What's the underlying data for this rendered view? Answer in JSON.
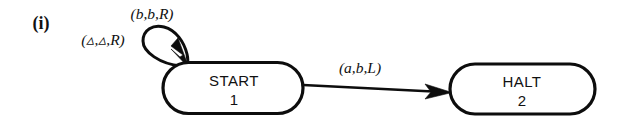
{
  "figure": {
    "tag": "(i)",
    "caption": ""
  },
  "diagram": {
    "type": "turing-machine-state-diagram",
    "background_color": "#ffffff",
    "stroke_color": "#0d0d0d",
    "nodes": [
      {
        "id": "start",
        "label": "START",
        "number": "1",
        "shape": "stadium",
        "x": 233,
        "y": 88,
        "width": 140,
        "height": 51
      },
      {
        "id": "halt",
        "label": "HALT",
        "number": "2",
        "shape": "stadium",
        "x": 522,
        "y": 89,
        "width": 145,
        "height": 50
      }
    ],
    "edges": [
      {
        "id": "self-loop-blank",
        "from": "start",
        "to": "start",
        "label": "(▵,▵,R)",
        "label_read": "blank",
        "label_write": "blank",
        "label_move": "R",
        "label_x": 103,
        "label_y": 45,
        "kind": "self-loop"
      },
      {
        "id": "self-loop-b",
        "from": "start",
        "to": "start",
        "label": "(b,b,R)",
        "label_read": "b",
        "label_write": "b",
        "label_move": "R",
        "label_x": 152,
        "label_y": 19,
        "kind": "self-loop-annotation"
      },
      {
        "id": "start-to-halt",
        "from": "start",
        "to": "halt",
        "label": "(a,b,L)",
        "label_read": "a",
        "label_write": "b",
        "label_move": "L",
        "label_x": 360,
        "label_y": 73,
        "kind": "directed-edge"
      }
    ]
  }
}
